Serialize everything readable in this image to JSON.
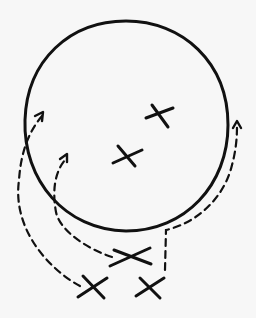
{
  "diagram": {
    "boundary": {
      "shape": "circle",
      "cx": 126,
      "cy": 126,
      "rx": 102,
      "ry": 105
    },
    "inside_marks": [
      {
        "x": 158,
        "y": 115,
        "size": 12
      },
      {
        "x": 127,
        "y": 155,
        "size": 12
      }
    ],
    "outside_marks": [
      {
        "x": 132,
        "y": 255,
        "size": 16
      },
      {
        "x": 93,
        "y": 288,
        "size": 12
      },
      {
        "x": 150,
        "y": 290,
        "size": 12
      }
    ],
    "arrows": [
      {
        "from": "outside-mark-2",
        "to": "inside-left-upper",
        "style": "dashed"
      },
      {
        "from": "outside-mark-1",
        "to": "inside-left-middle",
        "style": "dashed"
      },
      {
        "from": "outside-mark-3",
        "to": "right-edge",
        "style": "dashed"
      }
    ],
    "colors": {
      "ink": "#111111",
      "background": "#f7f7f7"
    }
  }
}
